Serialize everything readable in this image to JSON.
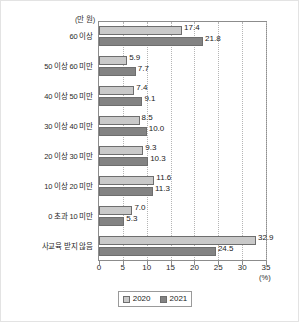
{
  "chart_data": {
    "type": "bar",
    "orientation": "horizontal",
    "title": "",
    "xlabel": "(%)",
    "ylabel": "(만 원)",
    "xlim": [
      0,
      35
    ],
    "xticks": [
      "0",
      "5",
      "10",
      "15",
      "20",
      "25",
      "30",
      "35"
    ],
    "grid": true,
    "legend_position": "bottom",
    "categories": [
      "60 이상",
      "50 이상 60 미만",
      "40 이상 50 미만",
      "30 이상 40 미만",
      "20 이상 30 미만",
      "10 이상 20 미만",
      "0 초과 10 미만",
      "사교육 받지 않음"
    ],
    "series": [
      {
        "name": "2020",
        "color": "#c9c9c9",
        "values": [
          17.4,
          5.9,
          7.4,
          8.5,
          9.3,
          11.6,
          7.0,
          32.9
        ],
        "labels": [
          "17.4",
          "5.9",
          "7.4",
          "8.5",
          "9.3",
          "11.6",
          "7.0",
          "32.9"
        ]
      },
      {
        "name": "2021",
        "color": "#838383",
        "values": [
          21.8,
          7.7,
          9.1,
          10.0,
          10.3,
          11.3,
          5.3,
          24.5
        ],
        "labels": [
          "21.8",
          "7.7",
          "9.1",
          "10.0",
          "10.3",
          "11.3",
          "5.3",
          "24.5"
        ]
      }
    ]
  }
}
